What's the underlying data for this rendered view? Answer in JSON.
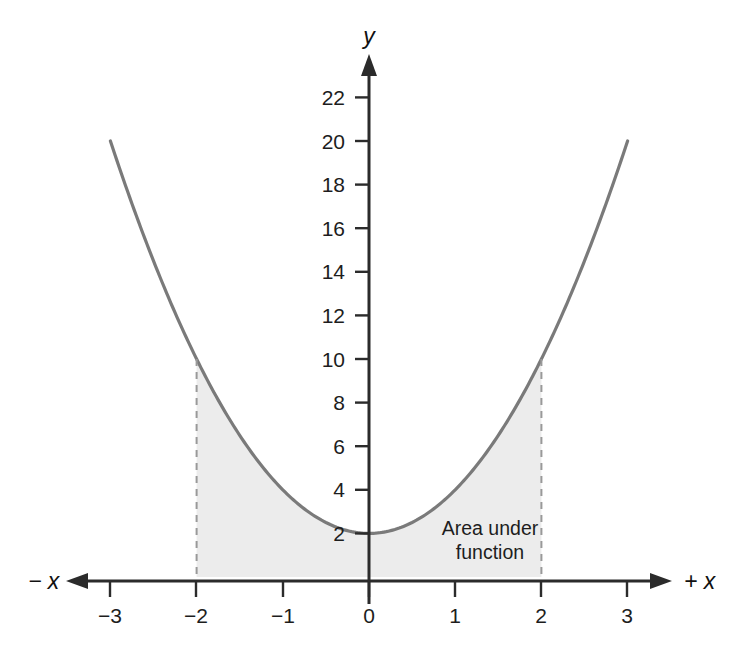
{
  "chart_data": {
    "type": "line",
    "title": "",
    "subtitle": "",
    "xlabel_negative": "− x",
    "xlabel_positive": "+ x",
    "ylabel": "y",
    "grid": false,
    "legend": "none",
    "xlim": [
      -3.45,
      3.45
    ],
    "ylim": [
      0,
      23.5
    ],
    "x_ticks": [
      -3,
      -2,
      -1,
      0,
      1,
      2,
      3
    ],
    "x_tick_labels": [
      "−3",
      "−2",
      "−1",
      "0",
      "1",
      "2",
      "3"
    ],
    "y_ticks": [
      2,
      4,
      6,
      8,
      10,
      12,
      14,
      16,
      18,
      20,
      22
    ],
    "y_tick_labels": [
      "2",
      "4",
      "6",
      "8",
      "10",
      "12",
      "14",
      "16",
      "18",
      "20",
      "22"
    ],
    "series": [
      {
        "name": "y = 2x^2 + 2",
        "expression": "2*x*x + 2",
        "x": [
          -3,
          -2.75,
          -2.5,
          -2.25,
          -2,
          -1.75,
          -1.5,
          -1.25,
          -1,
          -0.75,
          -0.5,
          -0.25,
          0,
          0.25,
          0.5,
          0.75,
          1,
          1.25,
          1.5,
          1.75,
          2,
          2.25,
          2.5,
          2.75,
          3
        ],
        "values": [
          20,
          17.125,
          14.5,
          12.125,
          10,
          8.125,
          6.5,
          5.125,
          4,
          3.125,
          2.5,
          2.125,
          2,
          2.125,
          2.5,
          3.125,
          4,
          5.125,
          6.5,
          8.125,
          10,
          12.125,
          14.5,
          17.125,
          20
        ],
        "color": "#7a7a7a"
      }
    ],
    "shaded_region": {
      "label_line1": "Area under",
      "label_line2": "function",
      "x_from": -2,
      "x_to": 2,
      "fill_color": "#ececec",
      "boundary_x_values": [
        -2,
        2
      ],
      "boundary_y_values": [
        10,
        10
      ],
      "boundary_style": "dashed",
      "boundary_color": "#999999"
    },
    "axis_color": "#2b2b2b",
    "vertex": {
      "x": 0,
      "y": 2
    }
  }
}
